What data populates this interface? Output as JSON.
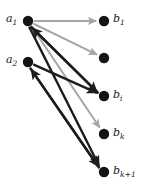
{
  "figure": {
    "width": 146,
    "height": 191,
    "background": "#ffffff"
  },
  "colors": {
    "node_fill": "#141414",
    "edge_dark": "#1c1c1c",
    "edge_light": "#a6a6a6",
    "label_color": "#1a1a1a"
  },
  "nodes": [
    {
      "id": "a1",
      "x": 28,
      "y": 21,
      "r": 5.2,
      "label_base": "a",
      "label_sub": "1",
      "label_x": 6,
      "label_y": 13,
      "has_label": true
    },
    {
      "id": "a2",
      "x": 28,
      "y": 62,
      "r": 5.2,
      "label_base": "a",
      "label_sub": "2",
      "label_x": 6,
      "label_y": 54,
      "has_label": true
    },
    {
      "id": "b1",
      "x": 104,
      "y": 21,
      "r": 5.2,
      "label_base": "b",
      "label_sub": "1",
      "label_x": 113,
      "label_y": 13,
      "has_label": true
    },
    {
      "id": "b_unlabeled",
      "x": 104,
      "y": 58,
      "r": 5.2,
      "label_base": "",
      "label_sub": "",
      "label_x": 113,
      "label_y": 50,
      "has_label": false
    },
    {
      "id": "bi",
      "x": 104,
      "y": 96,
      "r": 5.2,
      "label_base": "b",
      "label_sub": "i",
      "label_x": 113,
      "label_y": 89,
      "has_label": true
    },
    {
      "id": "bk",
      "x": 104,
      "y": 134,
      "r": 5.2,
      "label_base": "b",
      "label_sub": "k",
      "label_x": 113,
      "label_y": 127,
      "has_label": true
    },
    {
      "id": "bk1",
      "x": 104,
      "y": 172,
      "r": 5.2,
      "label_base": "b",
      "label_sub": "k+1",
      "label_x": 113,
      "label_y": 165,
      "has_label": true
    }
  ],
  "edges": [
    {
      "id": "e-a1-b1",
      "from": "a1",
      "to": "b1",
      "shade": "light",
      "width": 2.0,
      "arrow": true,
      "offset": 0
    },
    {
      "id": "e-a1-bunl",
      "from": "a1",
      "to": "b_unlabeled",
      "shade": "light",
      "width": 2.0,
      "arrow": true,
      "offset": 0
    },
    {
      "id": "e-a1-bk",
      "from": "a1",
      "to": "bk",
      "shade": "light",
      "width": 2.0,
      "arrow": true,
      "offset": 0
    },
    {
      "id": "e-a1-bi",
      "from": "a1",
      "to": "bi",
      "shade": "dark",
      "width": 2.4,
      "arrow": true,
      "offset": 2
    },
    {
      "id": "e-bi-a1",
      "from": "bi",
      "to": "a1",
      "shade": "dark",
      "width": 2.4,
      "arrow": true,
      "offset": -2
    },
    {
      "id": "e-a1-bk1",
      "from": "a1",
      "to": "bk1",
      "shade": "dark",
      "width": 2.4,
      "arrow": true,
      "offset": 1.6
    },
    {
      "id": "e-a2-bk1",
      "from": "a2",
      "to": "bk1",
      "shade": "dark",
      "width": 2.4,
      "arrow": true,
      "offset": 1.6
    },
    {
      "id": "e-bk1-a2",
      "from": "bk1",
      "to": "a2",
      "shade": "dark",
      "width": 2.4,
      "arrow": true,
      "offset": -1.6
    },
    {
      "id": "e-a2-bi",
      "from": "a2",
      "to": "bi",
      "shade": "dark",
      "width": 2.4,
      "arrow": true,
      "offset": 0
    }
  ],
  "legend": {
    "note": ""
  }
}
